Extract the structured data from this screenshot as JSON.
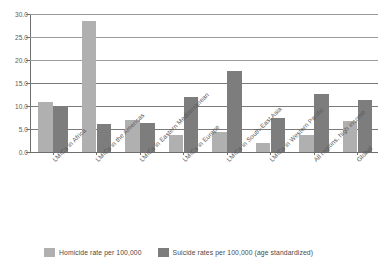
{
  "chart_data": {
    "type": "bar",
    "title": "",
    "subtitle": "",
    "xlabel": "",
    "ylabel": "",
    "ylim": [
      0.0,
      30.0
    ],
    "yticks": [
      "0.0",
      "5.0",
      "10.0",
      "15.0",
      "20.0",
      "25.0",
      "30.0"
    ],
    "grid": true,
    "legend_position": "bottom",
    "categories": [
      "LMICs in Africa",
      "LMICs in the Americas",
      "LMICs in Eastern Mediterranean",
      "LMICs in Europe",
      "LMICs in South-East Asia",
      "LMICs in Western Pacific",
      "All regions, high income",
      "Global"
    ],
    "series": [
      {
        "name": "Homicide rate per 100,000",
        "color": "#b0b0b0",
        "values": [
          10.9,
          28.5,
          6.9,
          3.8,
          4.3,
          2.0,
          3.7,
          6.7
        ]
      },
      {
        "name": "Suicide rates per 100,000 (age standardized)",
        "color": "#7d7d7d",
        "values": [
          9.9,
          6.0,
          6.3,
          12.0,
          17.6,
          7.4,
          12.6,
          11.2
        ]
      }
    ]
  },
  "legend": {
    "items": [
      {
        "label": "Homicide rate per 100,000"
      },
      {
        "label": "Suicide rates per 100,000 (age standardized)"
      }
    ]
  }
}
